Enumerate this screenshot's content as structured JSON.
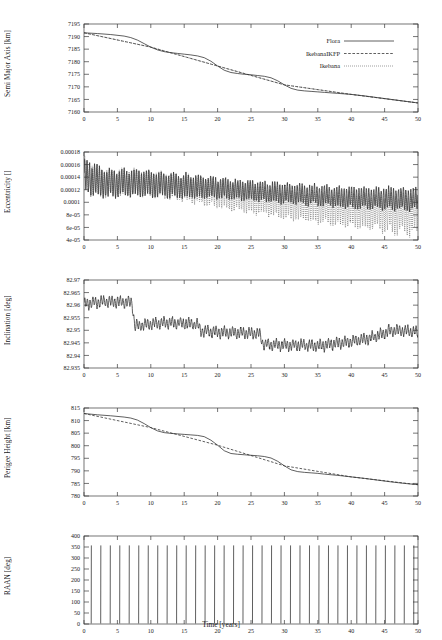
{
  "figure": {
    "xlabel": "Time [years]",
    "xlim": [
      0,
      50
    ],
    "xticks": [
      0,
      5,
      10,
      15,
      20,
      25,
      30,
      35,
      40,
      45,
      50
    ],
    "legend": {
      "position": "top-right-panel-1",
      "entries": [
        {
          "label": "Flora",
          "style": "solid"
        },
        {
          "label": "IkebanaIKFP",
          "style": "dashed"
        },
        {
          "label": "Ikebana",
          "style": "dotted"
        }
      ]
    }
  },
  "chart_data": [
    {
      "type": "line",
      "title": "",
      "xlabel": "",
      "ylabel": "Semi Major Axis [km]",
      "xlim": [
        0,
        50
      ],
      "ylim": [
        7160,
        7195
      ],
      "yticks": [
        7160,
        7165,
        7170,
        7175,
        7180,
        7185,
        7190,
        7195
      ],
      "xticks": [
        0,
        5,
        10,
        15,
        20,
        25,
        30,
        35,
        40,
        45,
        50
      ],
      "grid": false,
      "series": [
        {
          "name": "Flora",
          "style": "solid",
          "x": [
            0,
            2,
            4,
            6,
            7,
            8,
            9,
            10,
            11,
            12,
            13,
            14,
            15,
            16,
            17,
            18,
            19,
            20,
            21,
            22,
            23,
            24,
            25,
            26,
            27,
            28,
            29,
            30,
            31,
            32,
            33,
            34,
            35,
            36,
            38,
            40,
            42,
            44,
            46,
            48,
            50
          ],
          "values": [
            7191.5,
            7191.2,
            7190.8,
            7190.2,
            7189.6,
            7188.6,
            7187.2,
            7185.8,
            7184.7,
            7184.0,
            7183.6,
            7183.3,
            7183.0,
            7182.7,
            7182.3,
            7181.6,
            7180.2,
            7178.3,
            7176.6,
            7175.7,
            7175.3,
            7175.0,
            7174.8,
            7174.5,
            7174.2,
            7173.6,
            7172.4,
            7170.8,
            7169.4,
            7168.7,
            7168.4,
            7168.2,
            7168.0,
            7167.8,
            7167.4,
            7167.0,
            7166.4,
            7165.7,
            7165.0,
            7164.3,
            7163.6
          ]
        },
        {
          "name": "IkebanaIKFP",
          "style": "dashed",
          "x": [
            0,
            10,
            20,
            30,
            40,
            50
          ],
          "values": [
            7191.5,
            7185.8,
            7178.3,
            7170.8,
            7167.0,
            7163.6
          ]
        },
        {
          "name": "Ikebana",
          "style": "dotted",
          "x": [
            0,
            10,
            20,
            30,
            40,
            50
          ],
          "values": [
            7191.5,
            7185.8,
            7178.3,
            7170.8,
            7167.0,
            7163.6
          ]
        }
      ]
    },
    {
      "type": "line",
      "title": "",
      "xlabel": "",
      "ylabel": "Eccentricity []",
      "xlim": [
        0,
        50
      ],
      "ylim": [
        4e-05,
        0.00018
      ],
      "yticks": [
        4e-05,
        6e-05,
        8e-05,
        0.0001,
        0.00012,
        0.00014,
        0.00016,
        0.00018
      ],
      "ytick_labels": [
        "4e-05",
        "6e-05",
        "8e-05",
        "0.0001",
        "0.00012",
        "0.00014",
        "0.00016",
        "0.00018"
      ],
      "xticks": [
        0,
        5,
        10,
        15,
        20,
        25,
        30,
        35,
        40,
        45,
        50
      ],
      "grid": false,
      "oscillatory": true,
      "series": [
        {
          "name": "Flora",
          "style": "solid",
          "description": "high-frequency oscillation, envelope decaying",
          "envelope_upper": [
            0.000168,
            0.000152,
            0.00015,
            0.00015,
            0.000148,
            0.000145,
            0.000143,
            0.00014,
            0.000138,
            0.000135,
            0.000133,
            0.000131,
            0.000129,
            0.000127,
            0.000126,
            0.000124,
            0.000123,
            0.000122,
            0.000122,
            0.000121,
            0.000121
          ],
          "envelope_lower": [
            0.000118,
            0.00011,
            0.000111,
            0.000112,
            0.000111,
            0.00011,
            0.000109,
            0.000108,
            0.000107,
            0.000106,
            0.000104,
            0.000102,
            0.0001,
            9.8e-05,
            9.6e-05,
            9.4e-05,
            9.2e-05,
            9.1e-05,
            9e-05,
            8.9e-05,
            8.8e-05
          ],
          "envelope_x": [
            0,
            2.5,
            5,
            7.5,
            10,
            12.5,
            15,
            17.5,
            20,
            22.5,
            25,
            27.5,
            30,
            32.5,
            35,
            37.5,
            40,
            42.5,
            45,
            47.5,
            50
          ]
        },
        {
          "name": "Ikebana",
          "style": "dotted",
          "description": "diverges below Flora after year 15, lower envelope falls to 5e-05",
          "envelope_upper": [
            0.000168,
            0.000152,
            0.00015,
            0.00015,
            0.000148,
            0.000145,
            0.000142,
            0.000138,
            0.000134,
            0.00013,
            0.000126,
            0.000123,
            0.00012,
            0.000118,
            0.000116,
            0.000114,
            0.000113,
            0.000112,
            0.000111,
            0.00011,
            0.00011
          ],
          "envelope_lower": [
            0.000118,
            0.00011,
            0.000111,
            0.000112,
            0.00011,
            0.000108,
            0.000104,
            9.9e-05,
            9.4e-05,
            8.9e-05,
            8.5e-05,
            8.1e-05,
            7.7e-05,
            7.3e-05,
            6.9e-05,
            6.6e-05,
            6.3e-05,
            6e-05,
            5.7e-05,
            5.4e-05,
            5.1e-05
          ],
          "envelope_x": [
            0,
            2.5,
            5,
            7.5,
            10,
            12.5,
            15,
            17.5,
            20,
            22.5,
            25,
            27.5,
            30,
            32.5,
            35,
            37.5,
            40,
            42.5,
            45,
            47.5,
            50
          ]
        }
      ]
    },
    {
      "type": "line",
      "title": "",
      "xlabel": "",
      "ylabel": "Inclination [deg]",
      "xlim": [
        0,
        50
      ],
      "ylim": [
        82.935,
        82.97
      ],
      "yticks": [
        82.935,
        82.94,
        82.945,
        82.95,
        82.955,
        82.96,
        82.965,
        82.97
      ],
      "xticks": [
        0,
        5,
        10,
        15,
        20,
        25,
        30,
        35,
        40,
        45,
        50
      ],
      "grid": false,
      "oscillatory": true,
      "series": [
        {
          "name": "Flora",
          "style": "solid",
          "description": "noisy band with step drops at year 7.5 and 26.5, recovery after 45",
          "baseline_x": [
            0,
            3,
            6,
            7.2,
            7.6,
            9,
            11,
            13,
            15,
            17,
            17.5,
            19,
            21,
            23,
            25,
            26.3,
            26.8,
            29,
            31,
            33,
            35,
            37,
            39,
            41,
            43,
            45,
            46,
            48,
            50
          ],
          "baseline": [
            82.9605,
            82.9615,
            82.9612,
            82.961,
            82.9515,
            82.9522,
            82.9528,
            82.953,
            82.9528,
            82.9524,
            82.9498,
            82.9495,
            82.9492,
            82.949,
            82.9488,
            82.9486,
            82.9445,
            82.9442,
            82.944,
            82.9442,
            82.9438,
            82.9445,
            82.9452,
            82.946,
            82.947,
            82.949,
            82.95,
            82.9498,
            82.9492
          ],
          "band_halfwidth": 0.0022
        }
      ]
    },
    {
      "type": "line",
      "title": "",
      "xlabel": "",
      "ylabel": "Perigee Height [km]",
      "xlim": [
        0,
        50
      ],
      "ylim": [
        780,
        815
      ],
      "yticks": [
        780,
        785,
        790,
        795,
        800,
        805,
        810,
        815
      ],
      "xticks": [
        0,
        5,
        10,
        15,
        20,
        25,
        30,
        35,
        40,
        45,
        50
      ],
      "grid": false,
      "series": [
        {
          "name": "Flora",
          "style": "solid",
          "x": [
            0,
            2,
            4,
            6,
            7,
            8,
            9,
            10,
            11,
            12,
            13,
            14,
            15,
            16,
            17,
            18,
            19,
            20,
            21,
            22,
            23,
            24,
            25,
            26,
            27,
            28,
            29,
            30,
            31,
            32,
            33,
            34,
            35,
            36,
            38,
            40,
            42,
            44,
            46,
            48,
            50
          ],
          "values": [
            812.8,
            812.3,
            811.9,
            811.4,
            811.0,
            810.2,
            808.8,
            807.2,
            805.9,
            805.2,
            804.9,
            804.7,
            804.5,
            804.3,
            804.1,
            803.6,
            802.2,
            800.2,
            798.0,
            796.9,
            796.6,
            796.4,
            796.2,
            796.0,
            795.7,
            795.1,
            793.8,
            792.0,
            790.4,
            789.7,
            789.4,
            789.2,
            789.0,
            788.7,
            788.2,
            787.6,
            787.0,
            786.3,
            785.6,
            785.0,
            784.5
          ]
        },
        {
          "name": "IkebanaIKFP",
          "style": "dashed",
          "x": [
            0,
            10,
            20,
            30,
            40,
            50
          ],
          "values": [
            812.8,
            807.2,
            800.2,
            792.0,
            787.6,
            784.5
          ]
        }
      ]
    },
    {
      "type": "line",
      "title": "",
      "xlabel": "Time [years]",
      "ylabel": "RAAN [deg]",
      "xlim": [
        0,
        50
      ],
      "ylim": [
        0,
        400
      ],
      "yticks": [
        0,
        50,
        100,
        150,
        200,
        250,
        300,
        350,
        400
      ],
      "xticks": [
        0,
        5,
        10,
        15,
        20,
        25,
        30,
        35,
        40,
        45,
        50
      ],
      "grid": false,
      "waveform": "sawtooth",
      "series": [
        {
          "name": "Flora",
          "style": "solid",
          "description": "descending sawtooth from 360 to 0",
          "period_years": 1.42,
          "amplitude_min": 0,
          "amplitude_max": 360,
          "phase_start": 200
        }
      ]
    }
  ]
}
